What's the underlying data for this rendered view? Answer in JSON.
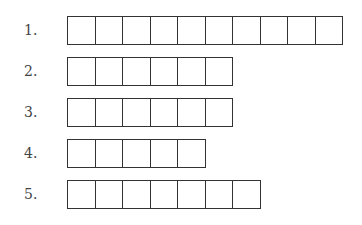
{
  "rows": [
    {
      "label": "1.",
      "cells": 10
    },
    {
      "label": "2.",
      "cells": 6
    },
    {
      "label": "3.",
      "cells": 6
    },
    {
      "label": "4.",
      "cells": 5
    },
    {
      "label": "5.",
      "cells": 7
    }
  ]
}
